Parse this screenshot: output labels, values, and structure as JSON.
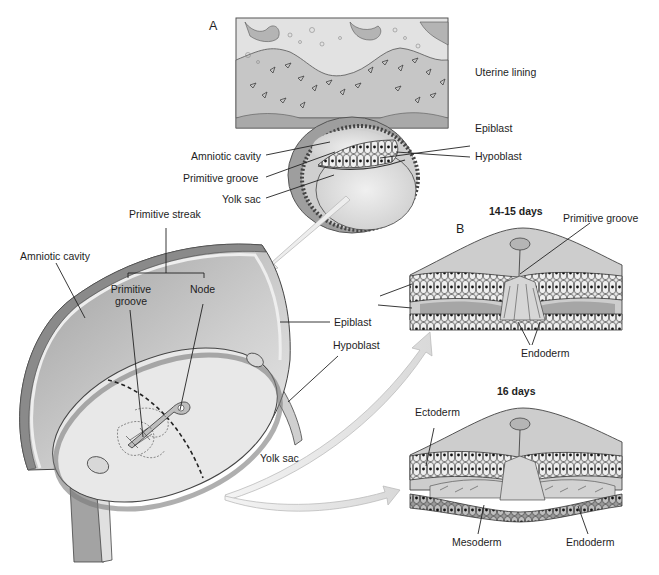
{
  "panels": {
    "a": {
      "letter": "A"
    },
    "b": {
      "letter": "B"
    }
  },
  "panel_a_labels": {
    "uterine_lining": "Uterine lining",
    "epiblast": "Epiblast",
    "hypoblast": "Hypoblast",
    "amniotic_cavity": "Amniotic cavity",
    "primitive_groove": "Primitive groove",
    "yolk_sac": "Yolk sac"
  },
  "disc_labels": {
    "primitive_streak": "Primitive streak",
    "amniotic_cavity": "Amniotic cavity",
    "primitive_groove_line1": "Primitive",
    "primitive_groove_line2": "groove",
    "node": "Node",
    "epiblast": "Epiblast",
    "hypoblast": "Hypoblast",
    "yolk_sac": "Yolk sac"
  },
  "panel_b_top": {
    "stage": "14-15 days",
    "primitive_groove": "Primitive groove",
    "endoderm": "Endoderm"
  },
  "panel_b_bottom": {
    "stage": "16 days",
    "ectoderm": "Ectoderm",
    "mesoderm": "Mesoderm",
    "endoderm": "Endoderm"
  },
  "colors": {
    "uterine_fill": "#c9c9c9",
    "uterine_dark": "#a6a6a6",
    "cavity_light": "#e4e4e4",
    "amnion_wall": "#8f8f8f",
    "cell_layer": "#d8d8d8",
    "arrow_fill": "#ececec",
    "line": "#222222"
  }
}
